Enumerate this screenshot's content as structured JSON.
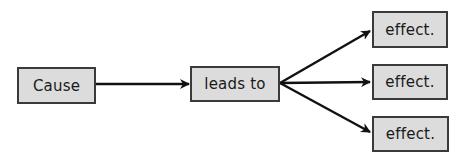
{
  "diagram": {
    "type": "cause-effect-flow",
    "nodes": [
      {
        "id": "cause",
        "label": "Cause"
      },
      {
        "id": "leads",
        "label": "leads to"
      },
      {
        "id": "effect1",
        "label": "effect."
      },
      {
        "id": "effect2",
        "label": "effect."
      },
      {
        "id": "effect3",
        "label": "effect."
      }
    ],
    "edges": [
      {
        "from": "cause",
        "to": "leads"
      },
      {
        "from": "leads",
        "to": "effect1"
      },
      {
        "from": "leads",
        "to": "effect2"
      },
      {
        "from": "leads",
        "to": "effect3"
      }
    ],
    "colors": {
      "box_fill": "#dcdcdc",
      "box_border": "#3a3a3a",
      "arrow": "#111111",
      "text": "#1a1a1a",
      "background": "#ffffff"
    }
  }
}
